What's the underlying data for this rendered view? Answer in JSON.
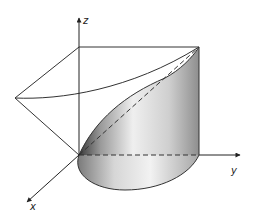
{
  "diagram": {
    "axes": {
      "x_label": "x",
      "y_label": "y",
      "z_label": "z"
    },
    "colors": {
      "line": "#333333",
      "shade_dark": "#4a4a4a",
      "shade_light": "#f4f4f4",
      "shade_mid": "#b8b8b8",
      "background": "#ffffff"
    }
  }
}
